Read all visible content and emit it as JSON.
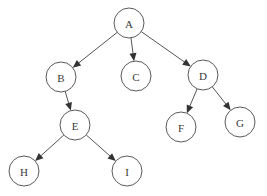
{
  "diagram": {
    "type": "directed-tree",
    "colors": {
      "node_stroke": "#5a5a5a",
      "node_fill": "#ffffff",
      "edge": "#555555",
      "label": "#3a3a3a"
    },
    "node_radius": 15,
    "nodes": [
      {
        "id": "A",
        "label": "A",
        "x": 129,
        "y": 23
      },
      {
        "id": "B",
        "label": "B",
        "x": 61,
        "y": 77
      },
      {
        "id": "C",
        "label": "C",
        "x": 136,
        "y": 76
      },
      {
        "id": "D",
        "label": "D",
        "x": 203,
        "y": 75
      },
      {
        "id": "E",
        "label": "E",
        "x": 75,
        "y": 125
      },
      {
        "id": "F",
        "label": "F",
        "x": 181,
        "y": 127
      },
      {
        "id": "G",
        "label": "G",
        "x": 240,
        "y": 122
      },
      {
        "id": "H",
        "label": "H",
        "x": 24,
        "y": 171
      },
      {
        "id": "I",
        "label": "I",
        "x": 127,
        "y": 171
      }
    ],
    "edges": [
      {
        "from": "A",
        "to": "B"
      },
      {
        "from": "A",
        "to": "C"
      },
      {
        "from": "A",
        "to": "D"
      },
      {
        "from": "B",
        "to": "E"
      },
      {
        "from": "D",
        "to": "F"
      },
      {
        "from": "D",
        "to": "G"
      },
      {
        "from": "E",
        "to": "H"
      },
      {
        "from": "E",
        "to": "I"
      }
    ]
  }
}
